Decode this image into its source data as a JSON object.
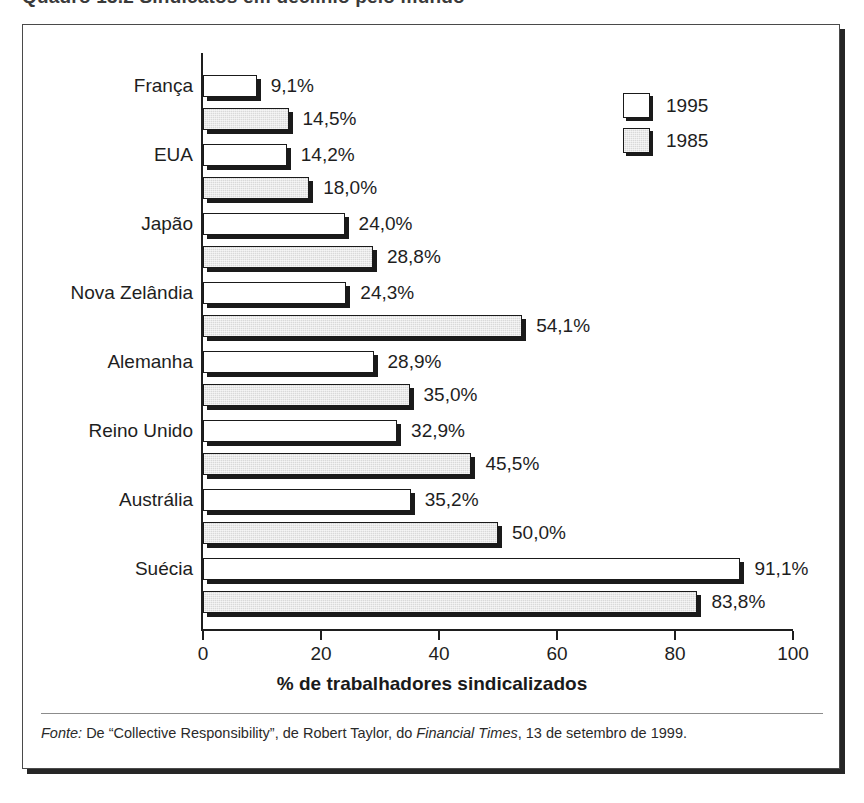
{
  "title": "Quadro 13.2  Sindicatos em declínio pelo mundo",
  "legend": {
    "position": "top-right",
    "items": [
      {
        "label": "1995",
        "swatch": "white-square-icon",
        "color": "#ffffff"
      },
      {
        "label": "1985",
        "swatch": "gray-square-icon",
        "color": "#d9d9d9"
      }
    ]
  },
  "axis": {
    "x_title": "% de trabalhadores sindicalizados",
    "x_ticks": [
      "0",
      "20",
      "40",
      "60",
      "80",
      "100"
    ]
  },
  "footnote": {
    "prefix": "Fonte:",
    "text_before": " De “Collective Responsibility”, de Robert Taylor, do ",
    "italic_source": "Financial Times",
    "text_after": ", 13 de setembro de 1999."
  },
  "bar_labels": {
    "franca_1995": "9,1%",
    "franca_1985": "14,5%",
    "eua_1995": "14,2%",
    "eua_1985": "18,0%",
    "japao_1995": "24,0%",
    "japao_1985": "28,8%",
    "nz_1995": "24,3%",
    "nz_1985": "54,1%",
    "alemanha_1995": "28,9%",
    "alemanha_1985": "35,0%",
    "reinounido_1995": "32,9%",
    "reinounido_1985": "45,5%",
    "australia_1995": "35,2%",
    "australia_1985": "50,0%",
    "suecia_1995": "91,1%",
    "suecia_1985": "83,8%"
  },
  "categories_labels": {
    "franca": "França",
    "eua": "EUA",
    "japao": "Japão",
    "nz": "Nova Zelândia",
    "alemanha": "Alemanha",
    "reinounido": "Reino Unido",
    "australia": "Austrália",
    "suecia": "Suécia"
  },
  "chart_data": {
    "type": "bar",
    "orientation": "horizontal",
    "title": "Quadro 13.2  Sindicatos em declínio pelo mundo",
    "xlabel": "% de trabalhadores sindicalizados",
    "ylabel": "",
    "xlim": [
      0,
      100
    ],
    "xticks": [
      0,
      20,
      40,
      60,
      80,
      100
    ],
    "grid": false,
    "legend_position": "top-right",
    "categories": [
      "França",
      "EUA",
      "Japão",
      "Nova Zelândia",
      "Alemanha",
      "Reino Unido",
      "Austrália",
      "Suécia"
    ],
    "series": [
      {
        "name": "1995",
        "color": "#ffffff",
        "values": [
          9.1,
          14.2,
          24.0,
          24.3,
          28.9,
          32.9,
          35.2,
          91.1
        ],
        "labels": [
          "9,1%",
          "14,2%",
          "24,0%",
          "24,3%",
          "28,9%",
          "32,9%",
          "35,2%",
          "91,1%"
        ]
      },
      {
        "name": "1985",
        "color": "#d9d9d9",
        "values": [
          14.5,
          18.0,
          28.8,
          54.1,
          35.0,
          45.5,
          50.0,
          83.8
        ],
        "labels": [
          "14,5%",
          "18,0%",
          "28,8%",
          "54,1%",
          "35,0%",
          "45,5%",
          "50,0%",
          "83,8%"
        ]
      }
    ],
    "source": "Fonte: De “Collective Responsibility”, de Robert Taylor, do Financial Times, 13 de setembro de 1999."
  }
}
